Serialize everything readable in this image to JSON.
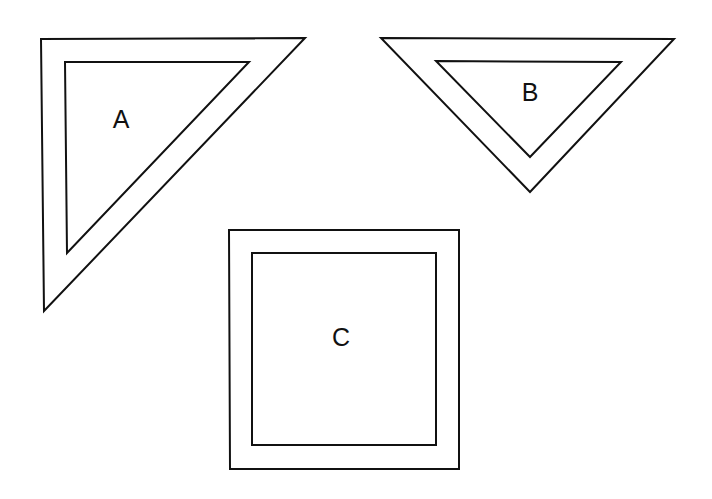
{
  "diagram": {
    "stroke_color": "#111111",
    "background": "#ffffff",
    "shapes": [
      {
        "id": "A",
        "type": "right-triangle-frame",
        "label": "A",
        "label_pos": [
          121,
          121
        ],
        "outer": [
          [
            41,
            39
          ],
          [
            305,
            38
          ],
          [
            44,
            311
          ]
        ],
        "inner": [
          [
            65,
            62
          ],
          [
            249,
            62
          ],
          [
            67,
            253
          ]
        ]
      },
      {
        "id": "B",
        "type": "inverted-triangle-frame",
        "label": "B",
        "label_pos": [
          530,
          94
        ],
        "outer": [
          [
            381,
            38
          ],
          [
            674,
            39
          ],
          [
            530,
            192
          ]
        ],
        "inner": [
          [
            436,
            61
          ],
          [
            621,
            62
          ],
          [
            530,
            157
          ]
        ]
      },
      {
        "id": "C",
        "type": "square-frame",
        "label": "C",
        "label_pos": [
          341,
          339
        ],
        "outer": [
          [
            229,
            230
          ],
          [
            459,
            230
          ],
          [
            459,
            469
          ],
          [
            230,
            469
          ]
        ],
        "inner": [
          [
            252,
            253
          ],
          [
            436,
            253
          ],
          [
            436,
            445
          ],
          [
            252,
            445
          ]
        ]
      }
    ]
  }
}
